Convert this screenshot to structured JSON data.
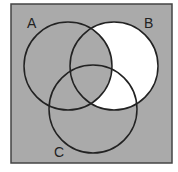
{
  "diagram": {
    "type": "venn",
    "universe": {
      "x": 11,
      "y": 4,
      "width": 161,
      "height": 159
    },
    "sets": [
      {
        "name": "A",
        "label": "A",
        "cx": 68,
        "cy": 66,
        "r": 44,
        "label_x": 27,
        "label_y": 28
      },
      {
        "name": "B",
        "label": "B",
        "cx": 114,
        "cy": 66,
        "r": 44,
        "label_x": 144,
        "label_y": 28
      },
      {
        "name": "C",
        "label": "C",
        "cx": 93,
        "cy": 109,
        "r": 44,
        "label_x": 54,
        "label_y": 157
      }
    ],
    "highlighted_region": "B ∩ A'",
    "colors": {
      "shaded": "#aaaaaa",
      "highlight": "#ffffff",
      "stroke": "#222222",
      "border": "#444444"
    }
  }
}
